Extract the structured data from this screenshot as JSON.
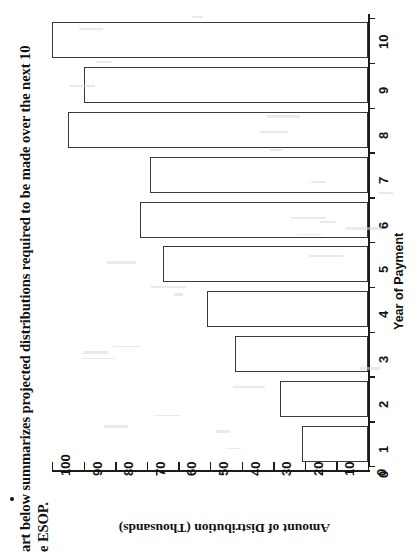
{
  "document": {
    "bullet_paragraph": {
      "line1": "art below summarizes projected distributions required to be made over the next 10",
      "line2": "e ESOP.",
      "bullet": "bullet-dot"
    }
  },
  "chart_data": {
    "type": "bar",
    "orientation": "vertical-rotated",
    "title": "",
    "xlabel": "Year of Payment",
    "ylabel": "Amount of Distribution (Thousands)",
    "categories": [
      "1",
      "2",
      "3",
      "4",
      "5",
      "6",
      "7",
      "8",
      "9",
      "10"
    ],
    "values": [
      21,
      28,
      42,
      51,
      65,
      72,
      69,
      95,
      90,
      100
    ],
    "ylim": [
      0,
      100
    ],
    "ytick_labels": [
      "0",
      "10",
      "20",
      "30",
      "40",
      "50",
      "60",
      "70",
      "80",
      "90",
      "100"
    ],
    "xtick_labels": [
      "0",
      "1",
      "2",
      "3",
      "4",
      "5",
      "6",
      "7",
      "8",
      "9",
      "10"
    ],
    "grid": false,
    "legend": false,
    "bar_fill": "#ffffff",
    "bar_stroke": "#3a3a3a",
    "axis_color": "#1b1b1b"
  }
}
